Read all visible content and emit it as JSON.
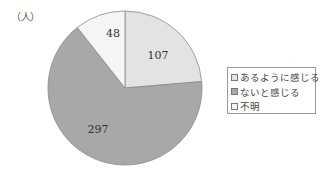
{
  "chart_data": {
    "type": "pie",
    "title": "",
    "unit_label": "（人）",
    "categories": [
      "あるように感じる",
      "ないと感じる",
      "不明"
    ],
    "values": [
      107,
      297,
      48
    ],
    "colors": [
      "#e3e3e3",
      "#a8a8a8",
      "#f5f5f5"
    ],
    "start_angle_deg": 0,
    "direction": "clockwise",
    "legend_position": "right",
    "legend": [
      {
        "label": "あるように感じる",
        "color": "#e3e3e3"
      },
      {
        "label": "ないと感じる",
        "color": "#a8a8a8"
      },
      {
        "label": "不明",
        "color": "#f5f5f5"
      }
    ],
    "slice_labels": [
      "107",
      "297",
      "48"
    ]
  }
}
